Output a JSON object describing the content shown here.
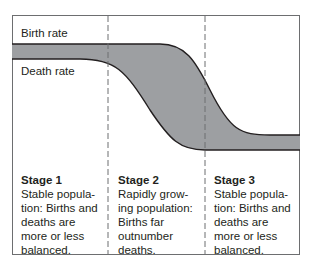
{
  "diagram": {
    "labels": {
      "birth_rate": "Birth rate",
      "death_rate": "Death rate"
    },
    "colors": {
      "fill": "#9d9fa2",
      "line": "#231f20",
      "frame": "#6d6e70",
      "divider": "#6d6e70"
    },
    "stages": [
      {
        "title": "Stage 1",
        "description": "Stable popula-\ntion: Births and\ndeaths are\nmore or less\nbalanced."
      },
      {
        "title": "Stage 2",
        "description": "Rapidly grow-\ning population:\nBirths far\noutnumber\ndeaths."
      },
      {
        "title": "Stage 3",
        "description": "Stable popula-\ntion: Births and\ndeaths are\nmore or less\nbalanced."
      }
    ]
  }
}
